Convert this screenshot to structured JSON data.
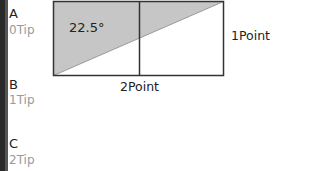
{
  "labels": [
    {
      "letter": "A",
      "tip": "0Tip"
    },
    {
      "letter": "B",
      "tip": "1Tip"
    },
    {
      "letter": "C",
      "tip": "2Tip"
    }
  ],
  "diagram": {
    "angle_label": "22.5°",
    "side_label_right": "1Point",
    "side_label_bottom": "2Point",
    "colors": {
      "fill": "#c6c6c6",
      "stroke": "#333333",
      "background": "#ffffff"
    }
  }
}
